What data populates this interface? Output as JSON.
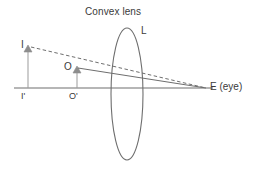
{
  "figure": {
    "title": "Convex lens",
    "background_color": "#ffffff",
    "stroke_color": "#6e6e6e",
    "text_color": "#3a3a3a",
    "width": 257,
    "height": 170
  },
  "labels": {
    "title": "Convex lens",
    "lens": "L",
    "image_point": "I",
    "object_point": "O",
    "image_foot": "I'",
    "object_foot": "O'",
    "eye": "E (eye)"
  },
  "diagram_data": {
    "type": "optics-ray-diagram",
    "description": "Convex lens forming a virtual magnified image; object O in front of lens, eye E on the far side, virtual image I located further out on the object side.",
    "optical_axis": {
      "x1": 14,
      "y1": 88,
      "x2": 213,
      "y2": 88
    },
    "lens": {
      "shape": "ellipse",
      "center_x": 127,
      "center_y": 94,
      "radius_x": 16,
      "radius_y": 66
    },
    "elements": [
      {
        "name": "object-arrow",
        "label": "O",
        "foot_label": "O'",
        "x": 77,
        "base_y": 88,
        "tip_y": 67,
        "style": "solid"
      },
      {
        "name": "image-arrow",
        "label": "I",
        "foot_label": "I'",
        "x": 28,
        "base_y": 88,
        "tip_y": 46,
        "style": "solid"
      }
    ],
    "rays": [
      {
        "name": "real-ray",
        "style": "solid",
        "from": [
          78,
          68
        ],
        "to": [
          206,
          88
        ]
      },
      {
        "name": "virtual-ray",
        "style": "dashed",
        "from": [
          31,
          47
        ],
        "to": [
          206,
          88
        ]
      }
    ],
    "eye_position": {
      "x": 206,
      "y": 88
    }
  }
}
